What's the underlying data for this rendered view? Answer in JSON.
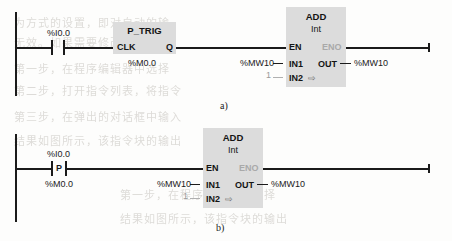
{
  "figure": {
    "caption_a": "a)",
    "caption_b": "b)"
  },
  "background_bleed": [
    "为方式的设置，即对自动的输",
    "无效。如果需要修改的话，可",
    "第一步，在程序编辑器中选择",
    "第二步，打开指令列表，将指令",
    "第三步，在弹出的对话框中输入",
    "结果如图所示，该指令块的输出"
  ],
  "rung_a": {
    "contact": {
      "above_label": "%I0.0",
      "inner_symbol": ""
    },
    "trigger_block": {
      "title": "P_TRIG",
      "input_pin": "CLK",
      "output_pin": "Q",
      "instance_label": "%M0.0"
    },
    "add_block": {
      "title": "ADD",
      "subtitle": "Int",
      "pin_en": "EN",
      "pin_eno": "ENO",
      "pin_in1": "IN1",
      "pin_in2": "IN2",
      "pin_out": "OUT",
      "operand_in1": "%MW10",
      "operand_in2": "1",
      "operand_out": "%MW10",
      "expand_icon": "⇨"
    }
  },
  "rung_b": {
    "contact": {
      "above_label": "%I0.0",
      "below_label": "%M0.0",
      "inner_symbol": "P"
    },
    "add_block": {
      "title": "ADD",
      "subtitle": "Int",
      "pin_en": "EN",
      "pin_eno": "ENO",
      "pin_in1": "IN1",
      "pin_in2": "IN2",
      "pin_out": "OUT",
      "operand_in1": "%MW10",
      "operand_in2": "1",
      "operand_out": "%MW10",
      "expand_icon": "⇨"
    }
  },
  "colors": {
    "wire": "#1b1b1b",
    "block_fill": "#dcdcdc",
    "disabled_text": "#a9a9a9"
  }
}
